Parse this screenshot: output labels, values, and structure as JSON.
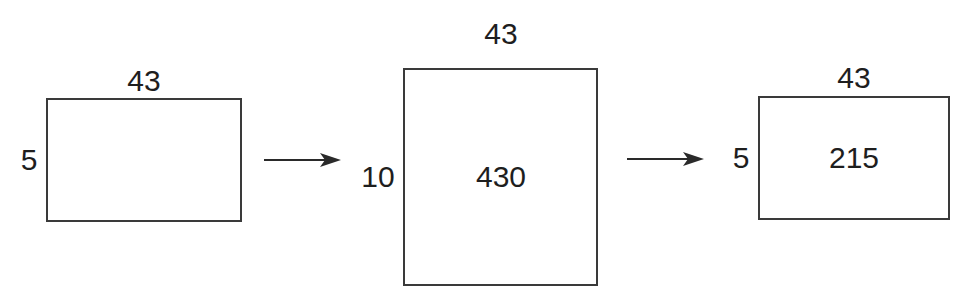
{
  "diagram": {
    "type": "dimension-transformation",
    "colors": {
      "stroke": "#3a3a3a",
      "text": "#1e1e1e",
      "background": "#ffffff"
    },
    "stages": [
      {
        "width_label": "43",
        "height_label": "5",
        "center_label": ""
      },
      {
        "width_label": "43",
        "height_label": "10",
        "center_label": "430"
      },
      {
        "width_label": "43",
        "height_label": "5",
        "center_label": "215"
      }
    ],
    "arrows": [
      {
        "from": 0,
        "to": 1,
        "icon": "arrow-right-icon"
      },
      {
        "from": 1,
        "to": 2,
        "icon": "arrow-right-icon"
      }
    ]
  }
}
